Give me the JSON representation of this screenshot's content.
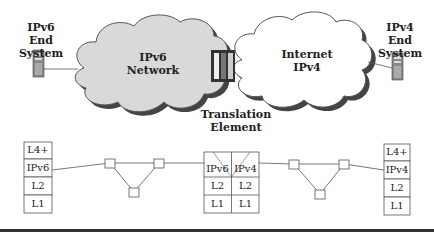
{
  "top": {
    "left_end_system": {
      "line1": "IPv6",
      "line2": "End System"
    },
    "right_end_system": {
      "line1": "IPv4",
      "line2": "End System"
    },
    "left_cloud": {
      "line1": "IPv6",
      "line2": "Network"
    },
    "right_cloud": {
      "line1": "Internet",
      "line2": "IPv4"
    },
    "translation": {
      "line1": "Translation",
      "line2": "Element"
    }
  },
  "stacks": {
    "left": [
      "L4+",
      "IPv6",
      "L2",
      "L1"
    ],
    "middle": {
      "left": [
        "IPv6",
        "L2",
        "L1"
      ],
      "right": [
        "IPv4",
        "L2",
        "L1"
      ]
    },
    "right": [
      "L4+",
      "IPv4",
      "L2",
      "L1"
    ]
  },
  "colors": {
    "cloud_fill": "#d9d9d9",
    "cloud_shadow": "#444444",
    "line": "#555555"
  }
}
